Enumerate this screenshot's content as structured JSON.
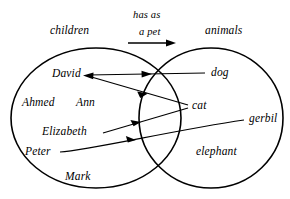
{
  "diagram": {
    "type": "set-relation-venn",
    "title_left": "children",
    "title_right": "animals",
    "relation": {
      "line1": "has as",
      "line2": "a pet",
      "arrow_direction": "left-to-right"
    },
    "left_set": {
      "name": "children",
      "members": [
        {
          "label": "David"
        },
        {
          "label": "Ahmed"
        },
        {
          "label": "Ann"
        },
        {
          "label": "Elizabeth"
        },
        {
          "label": "Peter"
        },
        {
          "label": "Mark"
        }
      ]
    },
    "right_set": {
      "name": "animals",
      "members": [
        {
          "label": "dog"
        },
        {
          "label": "cat"
        },
        {
          "label": "gerbil"
        },
        {
          "label": "elephant"
        }
      ]
    },
    "mappings": [
      {
        "from": "David",
        "to": "dog"
      },
      {
        "from": "David",
        "to": "cat"
      },
      {
        "from": "Elizabeth",
        "to": "cat"
      },
      {
        "from": "Peter",
        "to": "gerbil"
      }
    ],
    "colors": {
      "stroke": "#000000",
      "background": "#ffffff"
    }
  }
}
